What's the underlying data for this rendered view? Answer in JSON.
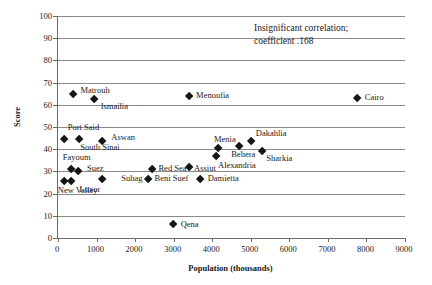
{
  "chart_data": {
    "type": "scatter",
    "title": "",
    "xlabel": "Population (thousands)",
    "ylabel": "Score",
    "xlim": [
      0,
      9000
    ],
    "ylim": [
      0,
      100
    ],
    "xticks": [
      "0",
      "1000",
      "2000",
      "3000",
      "4000",
      "5000",
      "6000",
      "7000",
      "8000",
      "9000"
    ],
    "yticks": [
      "0",
      "10",
      "20",
      "30",
      "40",
      "50",
      "60",
      "70",
      "80",
      "90",
      "100"
    ],
    "grid": "horizontal",
    "legend": "none",
    "annotations": [
      "Insignificant correlation;",
      "coefficient .168"
    ],
    "points": [
      {
        "label": "Port Said",
        "x": 150,
        "y": 44.5,
        "lx": 4,
        "ly": -12
      },
      {
        "label": "New Valley",
        "x": 150,
        "y": 25.5,
        "lx": -6,
        "ly": 9
      },
      {
        "label": "Matrouh",
        "x": 400,
        "y": 65.0,
        "lx": 7,
        "ly": -4
      },
      {
        "label": "Fayoum",
        "x": 330,
        "y": 31.0,
        "lx": -8,
        "ly": -12
      },
      {
        "label": "Luxor",
        "x": 350,
        "y": 25.5,
        "lx": 8,
        "ly": 8
      },
      {
        "label": "South Sinai",
        "x": 550,
        "y": 44.5,
        "lx": 1,
        "ly": 8
      },
      {
        "label": "Suez",
        "x": 520,
        "y": 30.0,
        "lx": 9,
        "ly": -3
      },
      {
        "label": "Ismailia",
        "x": 950,
        "y": 62.5,
        "lx": 6,
        "ly": 7
      },
      {
        "label": "Aswan",
        "x": 1150,
        "y": 43.5,
        "lx": 9,
        "ly": -4
      },
      {
        "label": "Suhag",
        "x": 1150,
        "y": 26.5,
        "lx": 19,
        "ly": -1
      },
      {
        "label": "Red Sea",
        "x": 2450,
        "y": 31.0,
        "lx": 6,
        "ly": -1
      },
      {
        "label": "Beni Suef",
        "x": 2350,
        "y": 26.5,
        "lx": 6,
        "ly": -1
      },
      {
        "label": "Qena",
        "x": 3000,
        "y": 6.0,
        "lx": 7,
        "ly": -1
      },
      {
        "label": "Assiut",
        "x": 3400,
        "y": 32.0,
        "lx": 5,
        "ly": 1
      },
      {
        "label": "Menoufia",
        "x": 3400,
        "y": 64.0,
        "lx": 7,
        "ly": -1
      },
      {
        "label": "Damietta",
        "x": 3700,
        "y": 26.5,
        "lx": 7,
        "ly": -1
      },
      {
        "label": "Alexandria",
        "x": 4100,
        "y": 37.0,
        "lx": 2,
        "ly": 9
      },
      {
        "label": "Menia",
        "x": 4150,
        "y": 40.5,
        "lx": -4,
        "ly": -9
      },
      {
        "label": "Behera",
        "x": 4700,
        "y": 41.5,
        "lx": -8,
        "ly": 8
      },
      {
        "label": "Dakahlia",
        "x": 5000,
        "y": 43.5,
        "lx": 5,
        "ly": -8
      },
      {
        "label": "Sharkia",
        "x": 5300,
        "y": 39.0,
        "lx": 4,
        "ly": 7
      },
      {
        "label": "Cairo",
        "x": 7750,
        "y": 63.0,
        "lx": 8,
        "ly": -1
      }
    ]
  }
}
